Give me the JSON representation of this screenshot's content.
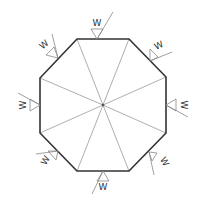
{
  "diagram": {
    "title": "",
    "shape": "octagon",
    "colors": {
      "outline": "#333333",
      "spokes": "#999999",
      "weld_symbol": "#888888",
      "label": "#333333",
      "background": "#ffffff"
    },
    "vertices": [
      [
        77,
        39
      ],
      [
        129,
        39
      ],
      [
        166,
        77
      ],
      [
        166,
        133
      ],
      [
        129,
        171
      ],
      [
        77,
        171
      ],
      [
        40,
        133
      ],
      [
        40,
        78
      ]
    ],
    "center": [
      103,
      105
    ],
    "weld_symbols": [
      {
        "id": "top",
        "label": "W"
      },
      {
        "id": "top-right",
        "label": "W"
      },
      {
        "id": "right",
        "label": "W"
      },
      {
        "id": "bottom-right",
        "label": "W"
      },
      {
        "id": "bottom",
        "label": "W"
      },
      {
        "id": "bottom-left",
        "label": "W"
      },
      {
        "id": "left",
        "label": "W"
      },
      {
        "id": "top-left",
        "label": "W"
      }
    ]
  }
}
